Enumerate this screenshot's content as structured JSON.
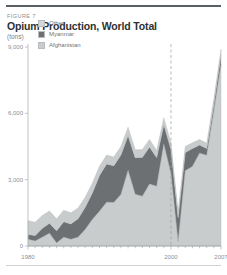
{
  "figure": {
    "label": "FIGURE 7",
    "title": "Opium Production, World Total",
    "units": "(tons)"
  },
  "chart_data": {
    "type": "area",
    "stacked": true,
    "title": "Opium Production, World Total",
    "subtitle": "(tons)",
    "xlabel": "",
    "ylabel": "tons",
    "xlim": [
      1980,
      2007
    ],
    "ylim": [
      0,
      9000
    ],
    "yticks": [
      0,
      3000,
      6000,
      9000
    ],
    "ytick_labels": [
      "0",
      "3,000",
      "6,000",
      "9,000"
    ],
    "xticks": [
      1980,
      2000,
      2007
    ],
    "xtick_labels": [
      "1980",
      "2000",
      "2007"
    ],
    "minor_xtick_interval": 1,
    "grid": false,
    "legend_position": "top-left-inside",
    "annotations": [
      {
        "type": "vline",
        "x": 2000,
        "style": "dashed",
        "color": "#9a9ea1"
      }
    ],
    "x": [
      1980,
      1981,
      1982,
      1983,
      1984,
      1985,
      1986,
      1987,
      1988,
      1989,
      1990,
      1991,
      1992,
      1993,
      1994,
      1995,
      1996,
      1997,
      1998,
      1999,
      2000,
      2001,
      2002,
      2003,
      2004,
      2005,
      2006,
      2007
    ],
    "series": [
      {
        "name": "Afghanistan",
        "color": "#c9cccd",
        "values": [
          300,
          225,
          400,
          575,
          140,
          400,
          300,
          400,
          750,
          1200,
          1570,
          1980,
          1970,
          2330,
          3420,
          2335,
          2250,
          2800,
          2700,
          4600,
          3280,
          185,
          3400,
          3600,
          4200,
          4100,
          6100,
          8200
        ]
      },
      {
        "name": "Myanmar",
        "color": "#6d7073",
        "values": [
          225,
          250,
          400,
          450,
          550,
          700,
          700,
          835,
          1000,
          1200,
          1620,
          1730,
          1660,
          1790,
          1580,
          1660,
          1760,
          1680,
          1300,
          895,
          1090,
          1100,
          830,
          810,
          370,
          310,
          315,
          460
        ]
      },
      {
        "name": "Other",
        "color": "#c9cccd",
        "values": [
          620,
          600,
          580,
          560,
          540,
          520,
          500,
          480,
          460,
          440,
          420,
          400,
          390,
          380,
          370,
          360,
          350,
          340,
          320,
          300,
          290,
          280,
          270,
          260,
          250,
          240,
          240,
          240
        ]
      }
    ],
    "legend": [
      {
        "label": "Other",
        "color": "#d4d7d8"
      },
      {
        "label": "Myanmar",
        "color": "#6d7073"
      },
      {
        "label": "Afghanistan",
        "color": "#c9cccd"
      }
    ]
  }
}
